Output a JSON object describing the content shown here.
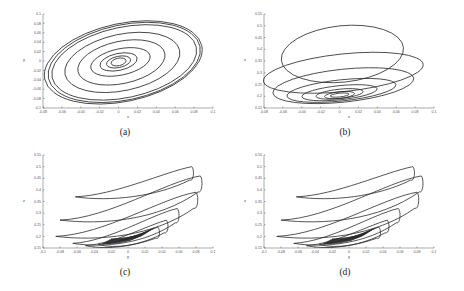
{
  "figure": {
    "panels": [
      {
        "id": "a",
        "caption": "(a)",
        "xlabel": "x",
        "ylabel": "y"
      },
      {
        "id": "b",
        "caption": "(b)",
        "xlabel": "x",
        "ylabel": "z"
      },
      {
        "id": "c",
        "caption": "(c)",
        "xlabel": "y",
        "ylabel": "z"
      },
      {
        "id": "d",
        "caption": "(d)",
        "xlabel": "y",
        "ylabel": "z"
      }
    ]
  },
  "chart_data": [
    {
      "id": "a",
      "type": "line",
      "title": "",
      "xlabel": "x",
      "ylabel": "y",
      "xlim": [
        -0.08,
        0.1
      ],
      "ylim": [
        -0.1,
        0.1
      ],
      "xticks": [
        "-0.08",
        "-0.06",
        "-0.04",
        "-0.02",
        "0",
        "0.02",
        "0.04",
        "0.06",
        "0.08",
        "0.1"
      ],
      "yticks": [
        "-0.1",
        "-0.08",
        "-0.06",
        "-0.04",
        "-0.02",
        "0",
        "0.02",
        "0.04",
        "0.06",
        "0.08",
        "0.1"
      ],
      "grid": false,
      "description": "Phase portrait: outward spiral of nested tilted ellipses centered near (0,0); outermost loop spans x≈-0.08..0.09, y≈-0.085..0.085",
      "loops": [
        {
          "cx": 0.0,
          "cy": -0.002,
          "rx": 0.008,
          "ry": 0.008
        },
        {
          "cx": 0.0,
          "cy": -0.002,
          "rx": 0.013,
          "ry": 0.012
        },
        {
          "cx": 0.0,
          "cy": -0.002,
          "rx": 0.02,
          "ry": 0.018
        },
        {
          "cx": 0.002,
          "cy": -0.002,
          "rx": 0.032,
          "ry": 0.028
        },
        {
          "cx": 0.003,
          "cy": -0.003,
          "rx": 0.047,
          "ry": 0.045
        },
        {
          "cx": 0.004,
          "cy": -0.003,
          "rx": 0.062,
          "ry": 0.06
        },
        {
          "cx": 0.006,
          "cy": -0.003,
          "rx": 0.078,
          "ry": 0.075
        },
        {
          "cx": 0.006,
          "cy": -0.003,
          "rx": 0.082,
          "ry": 0.08
        },
        {
          "cx": 0.005,
          "cy": -0.003,
          "rx": 0.085,
          "ry": 0.083
        }
      ]
    },
    {
      "id": "b",
      "type": "line",
      "title": "",
      "xlabel": "x",
      "ylabel": "z",
      "xlim": [
        -0.08,
        0.1
      ],
      "ylim": [
        0.15,
        0.55
      ],
      "xticks": [
        "-0.08",
        "-0.06",
        "-0.04",
        "-0.02",
        "0",
        "0.02",
        "0.04",
        "0.06",
        "0.08",
        "0.1"
      ],
      "yticks": [
        "0.15",
        "0.2",
        "0.25",
        "0.3",
        "0.35",
        "0.4",
        "0.45",
        "0.5",
        "0.55"
      ],
      "grid": false,
      "description": "Phase portrait x–z: tight spiral near (0,0.2) expanding into large loops rising to z≈0.5",
      "loops": [
        {
          "cx": 0.0,
          "cy": 0.205,
          "rx": 0.01,
          "ry": 0.008
        },
        {
          "cx": 0.0,
          "cy": 0.205,
          "rx": 0.016,
          "ry": 0.014
        },
        {
          "cx": 0.0,
          "cy": 0.21,
          "rx": 0.025,
          "ry": 0.02
        },
        {
          "cx": 0.0,
          "cy": 0.215,
          "rx": 0.04,
          "ry": 0.03
        },
        {
          "cx": 0.002,
          "cy": 0.225,
          "rx": 0.058,
          "ry": 0.045
        },
        {
          "cx": 0.004,
          "cy": 0.245,
          "rx": 0.075,
          "ry": 0.07
        },
        {
          "cx": 0.004,
          "cy": 0.3,
          "rx": 0.085,
          "ry": 0.08
        },
        {
          "cx": 0.003,
          "cy": 0.38,
          "rx": 0.065,
          "ry": 0.12
        }
      ]
    },
    {
      "id": "c",
      "type": "line",
      "title": "",
      "xlabel": "y",
      "ylabel": "z",
      "xlim": [
        -0.1,
        0.1
      ],
      "ylim": [
        0.15,
        0.55
      ],
      "xticks": [
        "-0.1",
        "-0.08",
        "-0.06",
        "-0.04",
        "-0.02",
        "0",
        "0.02",
        "0.04",
        "0.06",
        "0.08",
        "0.1"
      ],
      "yticks": [
        "0.15",
        "0.2",
        "0.25",
        "0.3",
        "0.35",
        "0.4",
        "0.45",
        "0.5",
        "0.55"
      ],
      "grid": false,
      "description": "Phase portrait y–z: nested crescent loops sweeping from lower-left to upper-right, tips at z≈0.5",
      "loops": [
        {
          "left": [
            -0.062,
            0.37
          ],
          "right": [
            0.075,
            0.5
          ]
        },
        {
          "left": [
            -0.08,
            0.27
          ],
          "right": [
            0.085,
            0.46
          ]
        },
        {
          "left": [
            -0.085,
            0.2
          ],
          "right": [
            0.08,
            0.39
          ]
        },
        {
          "left": [
            -0.065,
            0.17
          ],
          "right": [
            0.058,
            0.32
          ]
        },
        {
          "left": [
            -0.05,
            0.16
          ],
          "right": [
            0.045,
            0.27
          ]
        },
        {
          "left": [
            -0.035,
            0.165
          ],
          "right": [
            0.035,
            0.24
          ]
        }
      ]
    },
    {
      "id": "d",
      "type": "line",
      "title": "",
      "xlabel": "y",
      "ylabel": "z",
      "xlim": [
        -0.1,
        0.1
      ],
      "ylim": [
        0.15,
        0.55
      ],
      "xticks": [
        "-0.1",
        "-0.08",
        "-0.06",
        "-0.04",
        "-0.02",
        "0",
        "0.02",
        "0.04",
        "0.06",
        "0.08",
        "0.1"
      ],
      "yticks": [
        "0.15",
        "0.2",
        "0.25",
        "0.3",
        "0.35",
        "0.4",
        "0.45",
        "0.5",
        "0.55"
      ],
      "grid": false,
      "description": "Same phase portrait as (c)",
      "loops": [
        {
          "left": [
            -0.062,
            0.37
          ],
          "right": [
            0.075,
            0.5
          ]
        },
        {
          "left": [
            -0.08,
            0.27
          ],
          "right": [
            0.085,
            0.46
          ]
        },
        {
          "left": [
            -0.085,
            0.2
          ],
          "right": [
            0.08,
            0.39
          ]
        },
        {
          "left": [
            -0.065,
            0.17
          ],
          "right": [
            0.058,
            0.32
          ]
        },
        {
          "left": [
            -0.05,
            0.16
          ],
          "right": [
            0.045,
            0.27
          ]
        },
        {
          "left": [
            -0.035,
            0.165
          ],
          "right": [
            0.035,
            0.24
          ]
        }
      ]
    }
  ]
}
